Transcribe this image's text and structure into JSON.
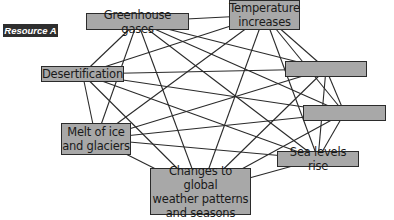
{
  "label": "Resource A",
  "colors": {
    "node_fill": "#a8a8a8",
    "node_border": "#2b2b2b",
    "edge": "#2a2a2a",
    "badge_bg": "#2e2e2e"
  },
  "nodes": [
    {
      "id": "greenhouse",
      "text": "Greenhouse gases",
      "x": 86,
      "y": 13,
      "w": 103,
      "h": 17
    },
    {
      "id": "temperature",
      "text": "Temperature\nincreases",
      "x": 229,
      "y": 0,
      "w": 71,
      "h": 30
    },
    {
      "id": "blank1",
      "text": "",
      "x": 285,
      "y": 61,
      "w": 82,
      "h": 16
    },
    {
      "id": "blank2",
      "text": "",
      "x": 303,
      "y": 105,
      "w": 83,
      "h": 16
    },
    {
      "id": "sea",
      "text": "Sea levels rise",
      "x": 277,
      "y": 151,
      "w": 82,
      "h": 16
    },
    {
      "id": "changes",
      "text": "Changes to global\nweather patterns\nand seasons",
      "x": 150,
      "y": 168,
      "w": 101,
      "h": 47
    },
    {
      "id": "melt",
      "text": "Melt of ice\nand glaciers",
      "x": 61,
      "y": 123,
      "w": 70,
      "h": 32
    },
    {
      "id": "desert",
      "text": "Desertification",
      "x": 41,
      "y": 66,
      "w": 83,
      "h": 16
    }
  ],
  "edges": "all-pairs"
}
